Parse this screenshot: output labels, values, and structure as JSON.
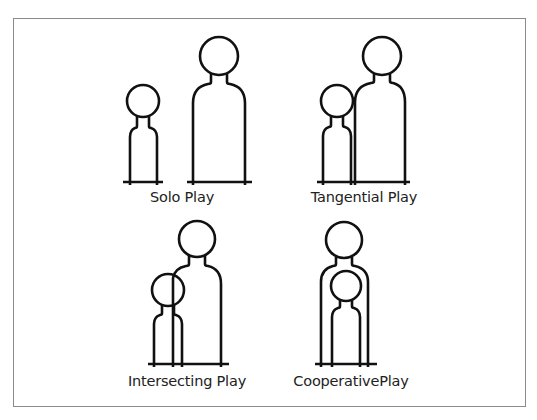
{
  "diagram": {
    "title": "",
    "stroke_color": "#111111",
    "frame_color": "#8a8a8a",
    "panels": [
      {
        "id": "solo",
        "label": "Solo Play",
        "description": "Child and adult figures standing apart"
      },
      {
        "id": "tangential",
        "label": "Tangential Play",
        "description": "Child and adult figures touching"
      },
      {
        "id": "intersecting",
        "label": "Intersecting Play",
        "description": "Child and adult figures overlapping"
      },
      {
        "id": "cooperative",
        "label": "CooperativePlay",
        "description": "Child figure nested inside adult figure"
      }
    ]
  }
}
